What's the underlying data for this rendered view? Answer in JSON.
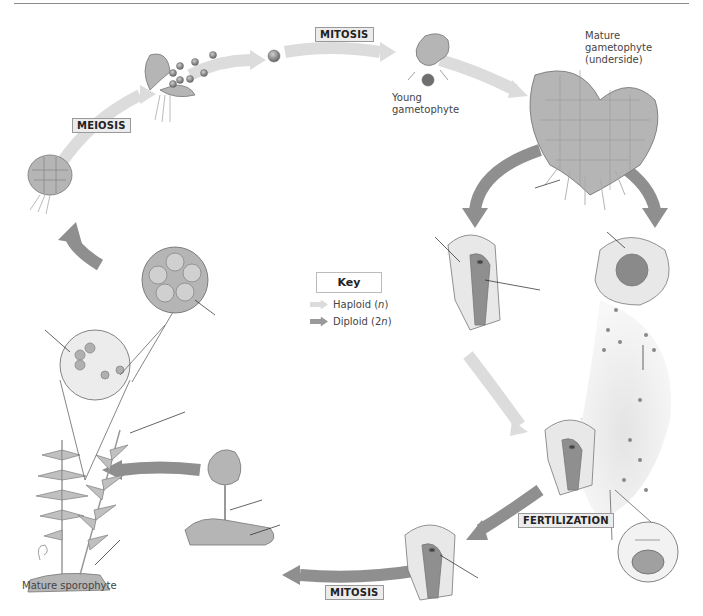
{
  "diagram": {
    "key": {
      "title": "Key",
      "items": [
        {
          "label": "Haploid (",
          "italic": "n",
          "suffix": ")",
          "color": "#d9d9d9"
        },
        {
          "label": "Diploid (2",
          "italic": "n",
          "suffix": ")",
          "color": "#9a9a9a"
        }
      ]
    },
    "stages": {
      "meiosis": "MEIOSIS",
      "mitosis_top": "MITOSIS",
      "fertilization": "FERTILIZATION",
      "mitosis_bottom": "MITOSIS"
    },
    "captions": {
      "young_gametophyte": "Young\ngametophyte",
      "mature_gametophyte": "Mature\ngametophyte\n(underside)",
      "mature_sporophyte": "Mature sporophyte"
    },
    "colors": {
      "haploid_arrow": "#dcdcdc",
      "diploid_arrow": "#8f8f8f",
      "tissue": "#b5b5b5",
      "cell_fill": "#e8e8e8"
    }
  }
}
